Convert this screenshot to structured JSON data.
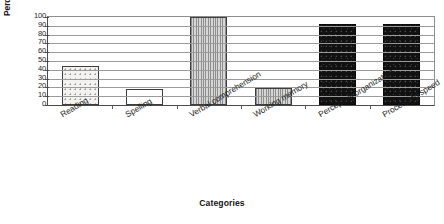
{
  "chart_data": {
    "type": "bar",
    "title": "",
    "xlabel": "Categories",
    "ylabel": "Percentile score",
    "categories": [
      "Reading",
      "Spelling",
      "Verbal comprehension",
      "Working memory",
      "Perceptual organization",
      "Processing speed"
    ],
    "values": [
      44,
      18,
      100,
      19,
      92,
      92
    ],
    "ylim": [
      0,
      100
    ],
    "ytick_labels": [
      "100",
      "90",
      "80",
      "70",
      "60",
      "50",
      "40",
      "30",
      "20",
      "10",
      "0"
    ],
    "ytick_values": [
      100,
      90,
      80,
      70,
      60,
      50,
      40,
      30,
      20,
      10,
      0
    ],
    "grid": true,
    "legend": "none",
    "bar_fills": [
      "dots",
      "open",
      "vhatch",
      "vhatch",
      "black",
      "black"
    ],
    "colors": {
      "axis": "#4a4a4a",
      "grid": "#9a9a9a",
      "bar_outline": "#3d3d3d",
      "bar_black": "#111111",
      "bar_gray": "#bdbdbd",
      "bar_open": "#ffffff",
      "text": "#1a1a1a"
    }
  }
}
